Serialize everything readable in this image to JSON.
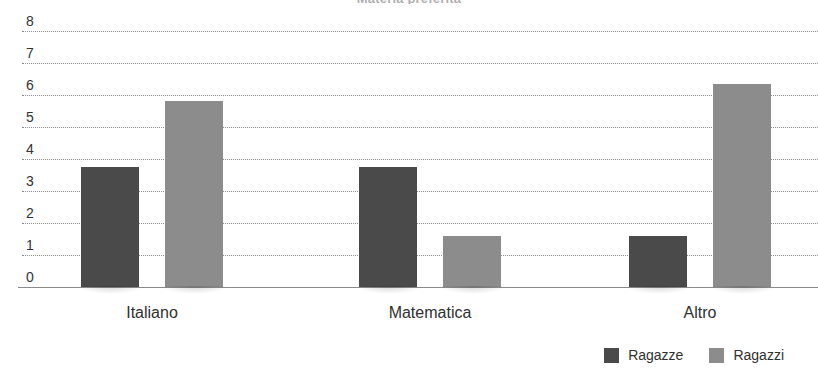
{
  "chart_data": {
    "type": "bar",
    "title": "Materia preferita",
    "subtitle": "",
    "xlabel": "",
    "ylabel": "",
    "categories": [
      "Italiano",
      "Matematica",
      "Altro"
    ],
    "series": [
      {
        "name": "Ragazze",
        "color": "#4a4a4a",
        "values": [
          3.75,
          3.75,
          1.6
        ]
      },
      {
        "name": "Ragazzi",
        "color": "#8c8c8c",
        "values": [
          5.8,
          1.6,
          6.35
        ]
      }
    ],
    "ylim": [
      0,
      8
    ],
    "ytick_labels": [
      "0",
      "1",
      "2",
      "3",
      "4",
      "5",
      "6",
      "7",
      "8"
    ],
    "ytick_values": [
      0,
      1,
      2,
      3,
      4,
      5,
      6,
      7,
      8
    ],
    "grid": true,
    "grid_style": "dotted",
    "legend_position": "bottom-right",
    "orientation": "vertical",
    "grouped": true
  },
  "axis": {
    "y_labels": [
      "8",
      "7",
      "6",
      "5",
      "4",
      "3",
      "2",
      "1",
      "0"
    ]
  },
  "legend": {
    "entries": [
      {
        "label": "Ragazze",
        "color": "#4a4a4a"
      },
      {
        "label": "Ragazzi",
        "color": "#8c8c8c"
      }
    ]
  },
  "colors": {
    "series_ragazze": "#4a4a4a",
    "series_ragazzi": "#8c8c8c",
    "grid": "#8d8d8d",
    "axis": "#8a8a8a",
    "text": "#303030",
    "background": "#ffffff"
  }
}
